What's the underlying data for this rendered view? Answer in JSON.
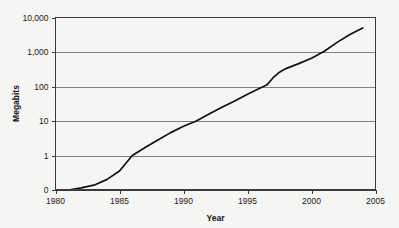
{
  "chart_data": {
    "type": "line",
    "title": "",
    "subtitle": "",
    "xlabel": "Year",
    "ylabel": "Megabits",
    "xlim": [
      1980,
      2005
    ],
    "ylim_note": "logarithmic axis; baseline tick shown as 0 below the decade 1",
    "y_scale": "log",
    "grid": true,
    "legend": "none",
    "x_ticks": [
      "1980",
      "1985",
      "1990",
      "1995",
      "2000",
      "2005"
    ],
    "x_tick_values": [
      1980,
      1985,
      1990,
      1995,
      2000,
      2005
    ],
    "y_ticks": [
      "10,000",
      "1,000",
      "100",
      "10",
      "1",
      "0"
    ],
    "y_tick_values": [
      10000,
      1000,
      100,
      10,
      1,
      0
    ],
    "series": [
      {
        "name": "Megabits",
        "x": [
          1981,
          1982,
          1983,
          1984,
          1985,
          1986,
          1987,
          1988,
          1989,
          1990,
          1991,
          1992,
          1993,
          1994,
          1995,
          1996,
          1996.5,
          1997,
          1997.5,
          1998,
          1999,
          2000,
          2001,
          2002,
          2003,
          2004
        ],
        "y": [
          0,
          0.06,
          0.14,
          0.3,
          0.55,
          1,
          1.7,
          2.8,
          4.6,
          7,
          10,
          16,
          25,
          38,
          60,
          90,
          110,
          180,
          260,
          330,
          460,
          660,
          1050,
          1900,
          3200,
          5000
        ]
      }
    ]
  },
  "axes": {
    "y_axis_label": "Megabits",
    "x_axis_label": "Year"
  },
  "colors": {
    "background": "#f5f5f3",
    "line": "#111111",
    "gridline": "#808080",
    "frame": "#3a3a3a",
    "text": "#1a1a1a"
  }
}
